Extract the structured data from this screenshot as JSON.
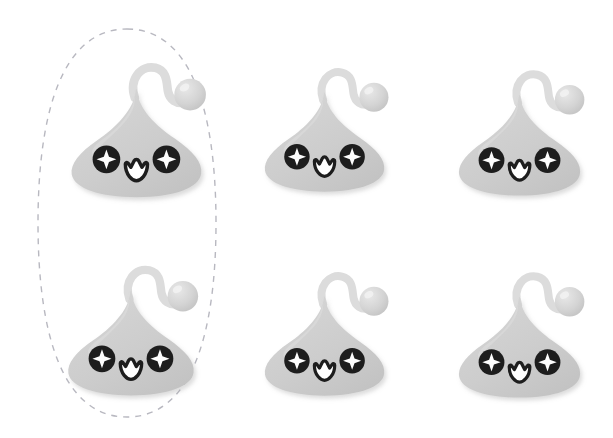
{
  "scene": {
    "title": "Blob Character Grid",
    "background_color": "#ffffff",
    "width": 613,
    "height": 438,
    "description": "Six identical gray teardrop blob characters in a 2x3 grid; the left column pair is circled by a dashed selection ellipse."
  },
  "palette": {
    "body_fill": "#cdcdcd",
    "body_fill_light": "#d6d6d6",
    "body_shadow": "#c2c2c2",
    "antenna_fill": "#dcdcdc",
    "antenna_ball_fill": "#d4d4d4",
    "antenna_ball_highlight": "#e8e8e8",
    "eye_dark": "#1d1d1d",
    "eye_sparkle": "#fdfdfd",
    "mouth_outline": "#1d1d1d",
    "mouth_fill": "#ffffff",
    "selection_stroke": "#b8b8c0",
    "page_background": "#ffffff"
  },
  "selection": {
    "label": "selection-ellipse",
    "shape": "rounded-ellipse",
    "stroke_color": "#b8b8c0",
    "stroke_width": 1.4,
    "dash_pattern": "6 6",
    "x": 38,
    "y": 29,
    "width": 178,
    "height": 388,
    "encircles": [
      "creature-1",
      "creature-4"
    ]
  },
  "creatures": [
    {
      "id": "creature-1",
      "label": "blob-character-1",
      "row": 0,
      "col": 0,
      "x": 58,
      "y": 52,
      "width": 160,
      "height": 150,
      "scale": 1.0,
      "expression": "happy",
      "eyes": "sparkle-star",
      "mouth": "open-w-smile",
      "antenna": "curved-stalk-with-ball",
      "selected": true
    },
    {
      "id": "creature-2",
      "label": "blob-character-2",
      "row": 0,
      "col": 1,
      "x": 252,
      "y": 58,
      "width": 148,
      "height": 138,
      "scale": 0.93,
      "expression": "happy",
      "eyes": "sparkle-star",
      "mouth": "open-w-smile",
      "antenna": "curved-stalk-with-ball",
      "selected": false
    },
    {
      "id": "creature-3",
      "label": "blob-character-3",
      "row": 0,
      "col": 2,
      "x": 446,
      "y": 60,
      "width": 150,
      "height": 140,
      "scale": 0.94,
      "expression": "happy",
      "eyes": "sparkle-star",
      "mouth": "open-w-smile",
      "antenna": "curved-stalk-with-ball",
      "selected": false
    },
    {
      "id": "creature-4",
      "label": "blob-character-4",
      "row": 1,
      "col": 0,
      "x": 55,
      "y": 255,
      "width": 155,
      "height": 145,
      "scale": 0.97,
      "expression": "happy",
      "eyes": "sparkle-star",
      "mouth": "open-w-smile",
      "antenna": "curved-stalk-with-ball",
      "selected": true
    },
    {
      "id": "creature-5",
      "label": "blob-character-5",
      "row": 1,
      "col": 1,
      "x": 252,
      "y": 262,
      "width": 148,
      "height": 138,
      "scale": 0.93,
      "expression": "happy",
      "eyes": "sparkle-star",
      "mouth": "open-w-smile",
      "antenna": "curved-stalk-with-ball",
      "selected": false
    },
    {
      "id": "creature-6",
      "label": "blob-character-6",
      "row": 1,
      "col": 2,
      "x": 446,
      "y": 262,
      "width": 150,
      "height": 140,
      "scale": 0.94,
      "expression": "happy",
      "eyes": "sparkle-star",
      "mouth": "open-w-smile",
      "antenna": "curved-stalk-with-ball",
      "selected": false
    }
  ],
  "chart_data": {
    "type": "table",
    "columns": [
      "row",
      "column",
      "character",
      "selected"
    ],
    "rows": [
      [
        1,
        1,
        "blob-character-1",
        "yes"
      ],
      [
        1,
        2,
        "blob-character-2",
        "no"
      ],
      [
        1,
        3,
        "blob-character-3",
        "no"
      ],
      [
        2,
        1,
        "blob-character-4",
        "yes"
      ],
      [
        2,
        2,
        "blob-character-5",
        "no"
      ],
      [
        2,
        3,
        "blob-character-6",
        "no"
      ]
    ]
  }
}
